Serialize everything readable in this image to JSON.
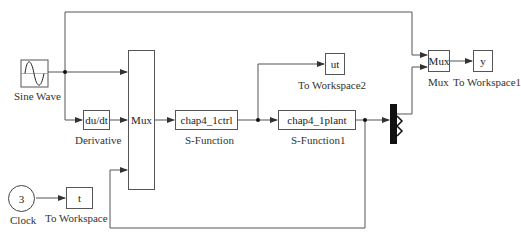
{
  "diagram": {
    "type": "Simulink block diagram",
    "blocks": {
      "sine_wave": {
        "label": "Sine Wave"
      },
      "derivative": {
        "text": "du/dt",
        "label": "Derivative"
      },
      "mux_main": {
        "text": "Mux"
      },
      "s_function": {
        "text": "chap4_1ctrl",
        "label": "S-Function"
      },
      "to_workspace2": {
        "text": "ut",
        "label": "To Workspace2"
      },
      "s_function1": {
        "text": "chap4_1plant",
        "label": "S-Function1"
      },
      "mux_right": {
        "text": "Mux",
        "label": "Mux"
      },
      "to_workspace1": {
        "text": "y",
        "label": "To Workspace1"
      },
      "clock": {
        "text": "3",
        "label": "Clock"
      },
      "to_workspace": {
        "text": "t",
        "label": "To Workspace"
      }
    },
    "colors": {
      "line": "#555555",
      "bar": "#111111",
      "background": "#ffffff"
    }
  }
}
